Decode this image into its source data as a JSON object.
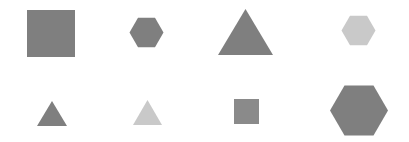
{
  "canvas": {
    "width": 409,
    "height": 142,
    "background": "#ffffff"
  },
  "colors": {
    "dark": "#7f7f7f",
    "medium": "#8a8a8a",
    "light": "#c9c9c9"
  },
  "shapes": [
    {
      "type": "square",
      "row": 1,
      "col": 1,
      "color": "#7f7f7f",
      "x": 27,
      "y": 10,
      "w": 48,
      "h": 47
    },
    {
      "type": "hexagon",
      "row": 1,
      "col": 2,
      "color": "#7f7f7f",
      "cx": 146.5,
      "cy": 32.5,
      "r": 17
    },
    {
      "type": "triangle",
      "row": 1,
      "col": 3,
      "color": "#7f7f7f",
      "x": 218,
      "y": 9,
      "w": 55,
      "h": 46
    },
    {
      "type": "hexagon",
      "row": 1,
      "col": 4,
      "color": "#c9c9c9",
      "cx": 358.5,
      "cy": 30.5,
      "r": 17
    },
    {
      "type": "triangle",
      "row": 2,
      "col": 1,
      "color": "#7f7f7f",
      "x": 37,
      "y": 101,
      "w": 30,
      "h": 25
    },
    {
      "type": "triangle",
      "row": 2,
      "col": 2,
      "color": "#c9c9c9",
      "x": 133,
      "y": 100,
      "w": 29,
      "h": 25
    },
    {
      "type": "square",
      "row": 2,
      "col": 3,
      "color": "#8a8a8a",
      "x": 234,
      "y": 99,
      "w": 25,
      "h": 25
    },
    {
      "type": "hexagon",
      "row": 2,
      "col": 4,
      "color": "#7f7f7f",
      "cx": 359,
      "cy": 110.5,
      "r": 29
    }
  ]
}
